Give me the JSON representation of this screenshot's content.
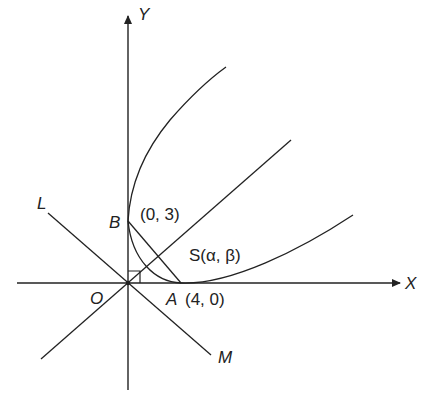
{
  "diagram": {
    "type": "coordinate-geometry",
    "stroke_color": "#222222",
    "axes": {
      "x_label": "X",
      "y_label": "Y",
      "origin_label": "O"
    },
    "points": {
      "B": {
        "label": "B",
        "coord_text": "(0, 3)"
      },
      "A": {
        "label": "A",
        "coord_text": "(4, 0)"
      },
      "S": {
        "label": "S(α, β)"
      }
    },
    "lines": {
      "L": {
        "label": "L"
      },
      "M": {
        "label": "M"
      }
    },
    "annotations": {
      "right_angle_at_origin": true
    }
  }
}
